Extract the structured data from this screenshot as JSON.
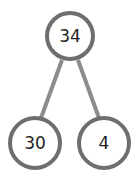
{
  "diagram": {
    "type": "number-bond",
    "whole": "34",
    "parts": [
      "30",
      "4"
    ],
    "colors": {
      "circle_stroke": "#6e6e6e",
      "connector": "#8c8c8c",
      "text": "#222222",
      "background": "#ffffff"
    }
  }
}
